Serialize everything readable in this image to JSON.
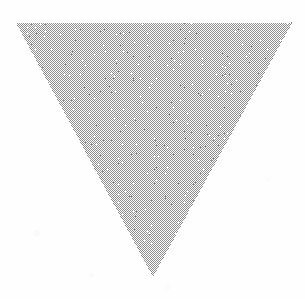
{
  "figure": {
    "type": "scanned-geometric-figure",
    "background_color": "#ffffff",
    "caption_number": "13",
    "shape": {
      "name": "inverted-triangle",
      "orientation": "point-down",
      "fill_style": "dithered-halftone-gray",
      "fill_color": "#9c9c9c",
      "fill_light_color": "#ffffff",
      "outline": "none",
      "vertices": [
        {
          "label": "top-left",
          "x": 16,
          "y": 23
        },
        {
          "label": "top-right",
          "x": 292,
          "y": 23
        },
        {
          "label": "bottom-apex",
          "x": 153,
          "y": 277
        }
      ]
    },
    "label": {
      "text": "13",
      "color": "#121212",
      "font_size_px": 62,
      "center_x": 151,
      "center_y": 121
    }
  }
}
